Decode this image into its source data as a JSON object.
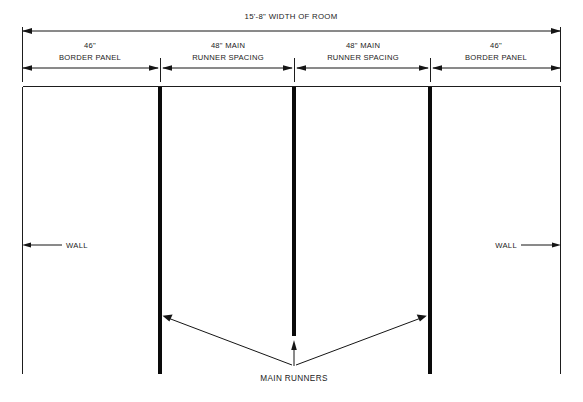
{
  "diagram": {
    "title_label": "15'-8\" WIDTH OF ROOM",
    "segments": [
      {
        "name": "left-border-panel",
        "line1": "46\"",
        "line2": "BORDER PANEL"
      },
      {
        "name": "left-main-runner-spacing",
        "line1": "48\" MAIN",
        "line2": "RUNNER SPACING"
      },
      {
        "name": "right-main-runner-spacing",
        "line1": "48\" MAIN",
        "line2": "RUNNER SPACING"
      },
      {
        "name": "right-border-panel",
        "line1": "46\"",
        "line2": "BORDER PANEL"
      }
    ],
    "wall_left_label": "WALL",
    "wall_right_label": "WALL",
    "main_runners_label": "MAIN RUNNERS",
    "colors": {
      "line": "#151515",
      "runner": "#0a0a0a",
      "background": "#ffffff",
      "text": "#1a1a1a"
    }
  }
}
